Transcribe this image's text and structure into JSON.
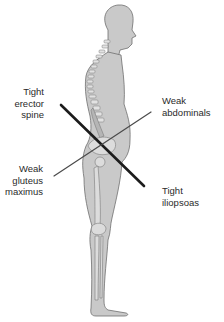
{
  "diagram": {
    "colors": {
      "body_fill": "#c9c9c9",
      "body_outline": "#6e6e6e",
      "bone_fill": "#dcdcdc",
      "tight_line": "#1c1c1c",
      "weak_line": "#4a4a4a",
      "text": "#2a2a2a",
      "background": "#ffffff"
    },
    "labels": {
      "tight_erector_spine": {
        "line1": "Tight",
        "line2": "erector",
        "line3": "spine"
      },
      "weak_abdominals": {
        "line1": "Weak",
        "line2": "abdominals"
      },
      "weak_gluteus_maximus": {
        "line1": "Weak",
        "line2": "gluteus",
        "line3": "maximus"
      },
      "tight_iliopsoas": {
        "line1": "Tight",
        "line2": "iliopsoas"
      }
    },
    "lines": [
      {
        "name": "tight-axis",
        "from": "erector spine",
        "to": "iliopsoas",
        "style": "thick"
      },
      {
        "name": "weak-axis",
        "from": "gluteus maximus",
        "to": "abdominals",
        "style": "thin"
      }
    ]
  }
}
